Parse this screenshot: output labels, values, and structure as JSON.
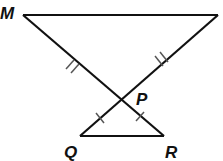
{
  "figure": {
    "type": "geometry",
    "labels": {
      "M": "M",
      "P": "P",
      "Q": "Q",
      "R": "R"
    },
    "points": {
      "M": [
        23,
        15
      ],
      "N": [
        218,
        15
      ],
      "P": [
        121,
        100
      ],
      "Q": [
        80,
        136
      ],
      "R": [
        164,
        136
      ]
    },
    "segments": [
      "MN",
      "MR",
      "NQ",
      "QR"
    ],
    "tick_marks": {
      "MP": 2,
      "NP": 2,
      "QP": 1,
      "PR": 1
    },
    "colors": {
      "line": "#111111",
      "tick": "#555555"
    }
  }
}
